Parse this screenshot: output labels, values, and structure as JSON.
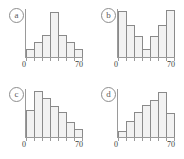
{
  "figure": {
    "panel_count": 4,
    "background_color": "#ffffff",
    "bar_fill_color": "#f2f2f2",
    "bar_outline_color": "#8a8a8a",
    "axis_color": "#9a9a9a"
  },
  "chart_data": [
    {
      "type": "bar",
      "panel_label": "a",
      "shape": "symmetric bell-shaped",
      "title": "",
      "xlabel": "",
      "ylabel": "",
      "xlim": [
        0,
        70
      ],
      "ylim": [
        0,
        10
      ],
      "grid": false,
      "legend": null,
      "bin_edges": [
        0,
        10,
        20,
        30,
        40,
        50,
        60,
        70
      ],
      "categories": [
        "0-10",
        "10-20",
        "20-30",
        "30-40",
        "40-50",
        "50-60",
        "60-70"
      ],
      "values": [
        1.6,
        3.2,
        4.6,
        9.4,
        4.6,
        3.2,
        1.6
      ],
      "tick_labels": [
        "0",
        "70"
      ]
    },
    {
      "type": "bar",
      "panel_label": "b",
      "shape": "U-shaped bimodal",
      "title": "",
      "xlabel": "",
      "ylabel": "",
      "xlim": [
        0,
        70
      ],
      "ylim": [
        0,
        10
      ],
      "grid": false,
      "legend": null,
      "bin_edges": [
        0,
        10,
        20,
        30,
        40,
        50,
        60,
        70
      ],
      "categories": [
        "0-10",
        "10-20",
        "20-30",
        "30-40",
        "40-50",
        "50-60",
        "60-70"
      ],
      "values": [
        9.5,
        6.6,
        4.4,
        1.7,
        4.4,
        6.6,
        9.8
      ],
      "tick_labels": [
        "0",
        "70"
      ]
    },
    {
      "type": "bar",
      "panel_label": "c",
      "shape": "right-skewed decreasing",
      "title": "",
      "xlabel": "",
      "ylabel": "",
      "xlim": [
        0,
        70
      ],
      "ylim": [
        0,
        10
      ],
      "grid": false,
      "legend": null,
      "bin_edges": [
        0,
        10,
        20,
        30,
        40,
        50,
        60,
        70
      ],
      "categories": [
        "0-10",
        "10-20",
        "20-30",
        "30-40",
        "40-50",
        "50-60",
        "60-70"
      ],
      "values": [
        5.6,
        9.6,
        8.2,
        6.4,
        5.3,
        3.2,
        1.7
      ],
      "tick_labels": [
        "0",
        "70"
      ]
    },
    {
      "type": "bar",
      "panel_label": "d",
      "shape": "left-skewed increasing",
      "title": "",
      "xlabel": "",
      "ylabel": "",
      "xlim": [
        0,
        70
      ],
      "ylim": [
        0,
        10
      ],
      "grid": false,
      "legend": null,
      "bin_edges": [
        0,
        10,
        20,
        30,
        40,
        50,
        60,
        70
      ],
      "categories": [
        "0-10",
        "10-20",
        "20-30",
        "30-40",
        "40-50",
        "50-60",
        "60-70"
      ],
      "values": [
        1.3,
        3.4,
        5.2,
        6.6,
        7.8,
        9.4,
        5.1
      ],
      "tick_labels": [
        "0",
        "70"
      ]
    }
  ]
}
